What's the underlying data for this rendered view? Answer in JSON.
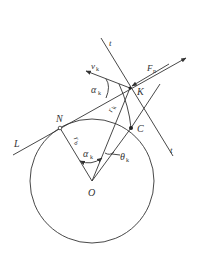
{
  "figure": {
    "type": "involute-geometry-diagram",
    "colors": {
      "stroke": "#333333",
      "background": "#ffffff"
    },
    "points": {
      "O": {
        "label": "O",
        "x": 92,
        "y": 181
      },
      "N": {
        "label": "N",
        "x": 60,
        "y": 128
      },
      "C": {
        "label": "C",
        "x": 131,
        "y": 128
      },
      "K": {
        "label": "K",
        "x": 130,
        "y": 88
      }
    },
    "lines": {
      "L": {
        "label": "L"
      },
      "t_top": {
        "label": "t"
      },
      "t_bottom": {
        "label": "t"
      }
    },
    "vectors": {
      "F": {
        "label": "F",
        "subscript": "n"
      },
      "v": {
        "label": "v",
        "subscript": "k"
      }
    },
    "radii": {
      "rb": {
        "label": "r",
        "subscript": "b"
      },
      "rk": {
        "label": "r",
        "subscript": "k"
      }
    },
    "angles": {
      "alpha_at_K": {
        "label": "α",
        "subscript": "k"
      },
      "alpha_at_O": {
        "label": "α",
        "subscript": "k"
      },
      "theta": {
        "label": "θ",
        "subscript": "k"
      }
    }
  }
}
